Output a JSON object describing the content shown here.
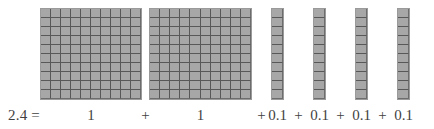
{
  "figure": {
    "kind": "base-ten-blocks-decimal-model",
    "background_color": "#ffffff",
    "block_fill_color": "#a7a7a7",
    "block_line_color": "#585858",
    "block_outline_color": "#9a9a9a",
    "text_color": "#3f3f3f",
    "blocks": [
      {
        "name": "flat-1",
        "type": "flat",
        "rows": 10,
        "cols": 10,
        "cells": 100,
        "value": "1",
        "x": 40,
        "y": 8,
        "w": 102,
        "h": 92
      },
      {
        "name": "flat-2",
        "type": "flat",
        "rows": 10,
        "cols": 10,
        "cells": 100,
        "value": "1",
        "x": 149,
        "y": 8,
        "w": 103,
        "h": 92
      },
      {
        "name": "rod-1",
        "type": "rod",
        "rows": 10,
        "cols": 1,
        "cells": 10,
        "value": "0.1",
        "x": 271,
        "y": 8,
        "w": 13,
        "h": 92
      },
      {
        "name": "rod-2",
        "type": "rod",
        "rows": 10,
        "cols": 1,
        "cells": 10,
        "value": "0.1",
        "x": 313,
        "y": 8,
        "w": 13,
        "h": 92
      },
      {
        "name": "rod-3",
        "type": "rod",
        "rows": 10,
        "cols": 1,
        "cells": 10,
        "value": "0.1",
        "x": 355,
        "y": 8,
        "w": 13,
        "h": 92
      },
      {
        "name": "rod-4",
        "type": "rod",
        "rows": 10,
        "cols": 1,
        "cells": 10,
        "value": "0.1",
        "x": 397,
        "y": 8,
        "w": 13,
        "h": 92
      }
    ]
  },
  "equation": {
    "lhs": "2.4 =",
    "plus": "+",
    "terms": [
      {
        "label": "1",
        "plus_before": false
      },
      {
        "label": "1",
        "plus_before": true
      },
      {
        "label": "0.1",
        "plus_before": true
      },
      {
        "label": "0.1",
        "plus_before": true
      },
      {
        "label": "0.1",
        "plus_before": true
      },
      {
        "label": "0.1",
        "plus_before": true
      }
    ],
    "full_text": "2.4 = 1 + 1 + 0.1 + 0.1 + 0.1 + 0.1"
  }
}
